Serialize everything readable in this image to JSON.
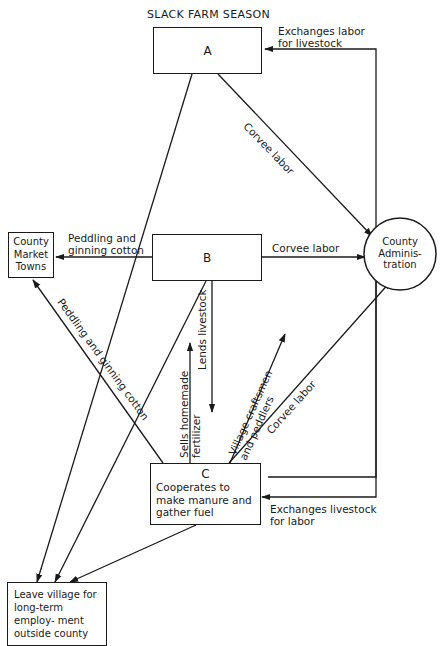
{
  "diagram": {
    "title": "SLACK FARM SEASON",
    "nodes": {
      "a": {
        "label": "A"
      },
      "b": {
        "label": "B"
      },
      "c": {
        "label": "C",
        "description": "Cooperates to make manure and gather fuel"
      },
      "market": {
        "label": "County Market Towns"
      },
      "admin": {
        "label": "County Adminis- tration"
      },
      "leave": {
        "label": "Leave village for long-term employ- ment outside county"
      }
    },
    "edges": {
      "c_to_a": {
        "label_line1": "Exchanges labor",
        "label_line2": "for livestock"
      },
      "a_to_c": {
        "label_line1": "Exchanges livestock",
        "label_line2": "for labor"
      },
      "a_to_admin": {
        "label": "Corvee labor"
      },
      "b_to_admin": {
        "label": "Corvee labor"
      },
      "c_to_admin": {
        "label": "Corvee labor"
      },
      "b_to_market": {
        "label_line1": "Peddling and",
        "label_line2": "ginning cotton"
      },
      "c_to_market": {
        "label": "Peddling and ginning cotton"
      },
      "b_to_c": {
        "label": "Lends livestock"
      },
      "c_to_b_fertilizer": {
        "label_line1": "Sells homemade",
        "label_line2": "fertilizer"
      },
      "c_craftsmen": {
        "label_line1": "Village craftsmen",
        "label_line2": "and peddlers"
      },
      "a_to_leave": {
        "label": ""
      },
      "b_to_leave": {
        "label": ""
      },
      "c_to_leave": {
        "label": ""
      }
    }
  }
}
